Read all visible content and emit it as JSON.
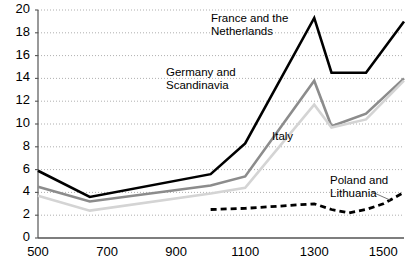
{
  "chart_data": {
    "type": "line",
    "title": "",
    "xlabel": "",
    "ylabel": "",
    "xlim": [
      500,
      1560
    ],
    "ylim": [
      0,
      20
    ],
    "xticks": [
      500,
      700,
      900,
      1100,
      1300,
      1500
    ],
    "yticks": [
      0,
      2,
      4,
      6,
      8,
      10,
      12,
      14,
      16,
      18,
      20
    ],
    "grid": "horizontal-dotted",
    "legend": "inline-annotations",
    "series": [
      {
        "name": "France and the Netherlands",
        "style": "solid",
        "color": "#000000",
        "width": 2.6,
        "label_text": "France and the\nNetherlands",
        "x": [
          500,
          650,
          1000,
          1100,
          1300,
          1350,
          1450,
          1560
        ],
        "y": [
          5.9,
          3.6,
          5.6,
          8.3,
          19.3,
          14.5,
          14.5,
          19.0
        ]
      },
      {
        "name": "Germany and Scandinavia",
        "style": "solid",
        "color": "#8c8c8c",
        "width": 2.6,
        "label_text": "Germany and\nScandinavia",
        "x": [
          500,
          650,
          1000,
          1100,
          1300,
          1350,
          1450,
          1560
        ],
        "y": [
          4.5,
          3.2,
          4.6,
          5.4,
          13.8,
          9.8,
          10.9,
          14.0
        ]
      },
      {
        "name": "Italy",
        "style": "solid",
        "color": "#d4d4d4",
        "width": 2.6,
        "label_text": "Italy",
        "x": [
          500,
          650,
          1000,
          1100,
          1300,
          1350,
          1450,
          1560
        ],
        "y": [
          3.7,
          2.4,
          3.9,
          4.4,
          11.7,
          9.7,
          10.4,
          13.8
        ]
      },
      {
        "name": "Poland and Lithuania",
        "style": "dashed",
        "color": "#000000",
        "width": 2.8,
        "label_text": "Poland and\nLithuania",
        "x": [
          1000,
          1100,
          1250,
          1300,
          1350,
          1400,
          1450,
          1500,
          1560
        ],
        "y": [
          2.5,
          2.6,
          2.9,
          3.0,
          2.5,
          2.2,
          2.5,
          3.0,
          4.0
        ]
      }
    ],
    "annotations": [
      {
        "name": "france-netherlands-label",
        "text": "France and the\nNetherlands",
        "x_px": 211,
        "y_px": 12
      },
      {
        "name": "germany-scandinavia-label",
        "text": "Germany and\nScandinavia",
        "x_px": 166,
        "y_px": 66
      },
      {
        "name": "italy-label",
        "text": "Italy",
        "x_px": 272,
        "y_px": 130
      },
      {
        "name": "poland-lithuania-label",
        "text": "Poland and\nLithuania",
        "x_px": 330,
        "y_px": 174
      }
    ],
    "leader_lines": [
      {
        "name": "poland-leader-line",
        "x1": 372,
        "y1": 192,
        "x2": 390,
        "y2": 200
      }
    ]
  },
  "axes": {
    "y_labels": [
      "20",
      "18",
      "16",
      "14",
      "12",
      "10",
      "8",
      "6",
      "4",
      "2",
      "0"
    ],
    "x_labels": [
      "500",
      "700",
      "900",
      "1100",
      "1300",
      "1500"
    ]
  }
}
